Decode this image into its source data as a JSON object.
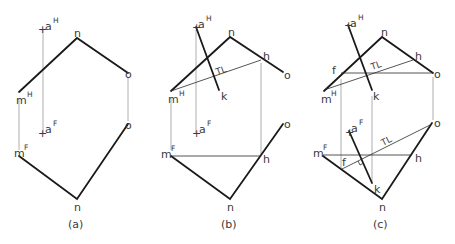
{
  "figure": {
    "panels": [
      {
        "caption": "(a)",
        "labels": {
          "aH": "a",
          "aH_sup": "H",
          "aF": "a",
          "aF_sup": "F",
          "n_top": "n",
          "o_top": "o",
          "mH": "m",
          "mH_sup": "H",
          "mF": "m",
          "mF_sup": "F",
          "o_bot": "o",
          "n_bot": "n"
        }
      },
      {
        "caption": "(b)",
        "labels": {
          "aH": "a",
          "aH_sup": "H",
          "aF": "a",
          "aF_sup": "F",
          "n_top": "n",
          "h_top": "h",
          "o_top": "o",
          "mH": "m",
          "mH_sup": "H",
          "k_top": "k",
          "tl": "TL",
          "mF": "m",
          "mF_sup": "F",
          "h_bot": "h",
          "o_bot": "o",
          "n_bot": "n"
        }
      },
      {
        "caption": "(c)",
        "labels": {
          "aH": "a",
          "aH_sup": "H",
          "aF": "a",
          "aF_sup": "F",
          "n_top": "n",
          "h_top": "h",
          "o_top": "o",
          "f_top": "f",
          "mH": "m",
          "mH_sup": "H",
          "k_top": "k",
          "tl_top": "TL",
          "mF": "m",
          "mF_sup": "F",
          "h_bot": "h",
          "o_bot": "o",
          "f_bot": "f",
          "k_bot": "k",
          "tl_bot": "TL",
          "n_bot": "n"
        }
      }
    ]
  }
}
